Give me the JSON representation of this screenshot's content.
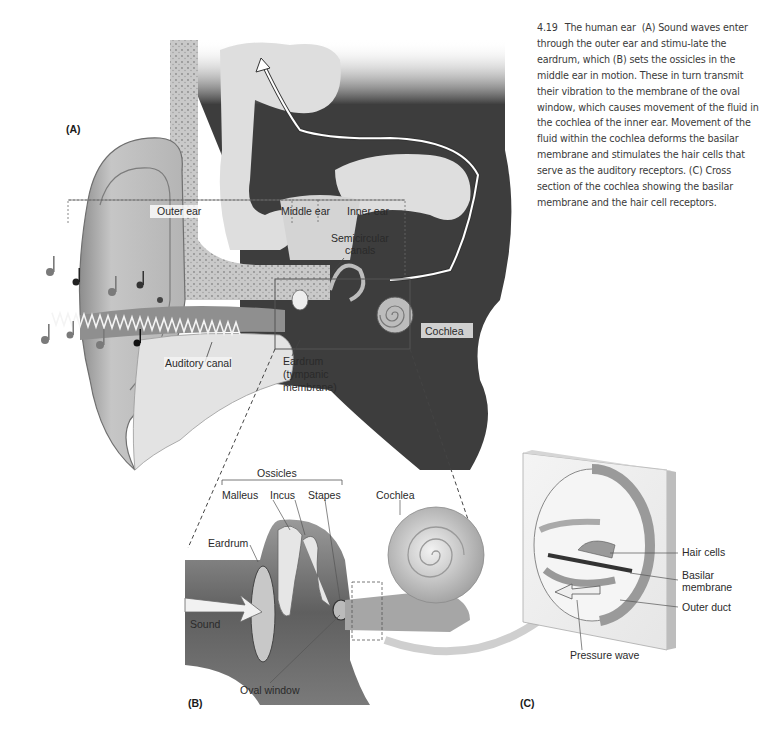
{
  "caption": {
    "figure_number": "4.19",
    "title": "The human ear",
    "body": "(A) Sound waves enter through the outer ear and stimu-late the eardrum, which (B) sets the ossicles in the middle ear in motion. These in turn transmit their vibration to the membrane of the oval window, which causes movement of the fluid in the cochlea of the inner ear. Movement of the fluid within the cochlea deforms the basilar membrane and stimulates the hair cells that serve as the auditory receptors. (C) Cross section of the cochlea showing the basilar membrane and the hair cell receptors."
  },
  "panels": {
    "a": {
      "label": "(A)",
      "regions": {
        "outer": "Outer ear",
        "middle": "Middle ear",
        "inner": "Inner ear"
      },
      "labels": {
        "semicircular_1": "Semicircular",
        "semicircular_2": "canals",
        "cochlea": "Cochlea",
        "auditory_canal": "Auditory canal",
        "eardrum_1": "Eardrum",
        "eardrum_2": "(tympanic",
        "eardrum_3": "membrane)"
      }
    },
    "b": {
      "label": "(B)",
      "labels": {
        "ossicles": "Ossicles",
        "malleus": "Malleus",
        "incus": "Incus",
        "stapes": "Stapes",
        "cochlea": "Cochlea",
        "eardrum": "Eardrum",
        "sound": "Sound",
        "oval_window": "Oval window"
      }
    },
    "c": {
      "label": "(C)",
      "labels": {
        "hair_cells": "Hair cells",
        "basilar_1": "Basilar",
        "basilar_2": "membrane",
        "outer_duct": "Outer duct",
        "pressure_wave": "Pressure wave"
      }
    }
  },
  "colors": {
    "tissue_light": "#d9d9d9",
    "tissue_mid": "#a8a8a8",
    "tissue_dark": "#4a4a4a",
    "brain": "#dcdcdc",
    "bone": "#c8c8c8",
    "text": "#2a2a2a"
  }
}
